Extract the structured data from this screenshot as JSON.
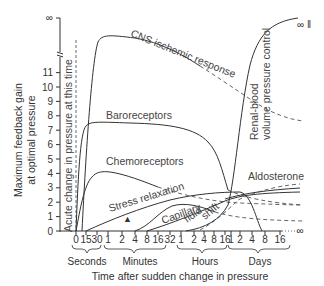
{
  "chart_data": {
    "type": "line",
    "title": "",
    "xlabel": "Time after sudden change in pressure",
    "ylabel_line1": "Maximum feedback gain",
    "ylabel_line2": "at optimal pressure",
    "y_ticks": [
      "0",
      "1",
      "2",
      "3",
      "4",
      "5",
      "6",
      "7",
      "8",
      "9",
      "10",
      "11"
    ],
    "y_infinity_label": "∞",
    "ylim": [
      0,
      11
    ],
    "x_ticks": [
      "0",
      "15",
      "30",
      "1",
      "2",
      "4",
      "8",
      "16",
      "32",
      "1",
      "2",
      "4",
      "8",
      "16",
      "1",
      "2",
      "4",
      "8",
      "16",
      "∞"
    ],
    "x_groups": [
      {
        "label": "Seconds",
        "ticks": [
          "0",
          "15",
          "30"
        ]
      },
      {
        "label": "Minutes",
        "ticks": [
          "1",
          "2",
          "4",
          "8",
          "16",
          "32"
        ]
      },
      {
        "label": "Hours",
        "ticks": [
          "1",
          "2",
          "4",
          "8",
          "16"
        ]
      },
      {
        "label": "Days",
        "ticks": [
          "1",
          "2",
          "4",
          "8",
          "16"
        ]
      }
    ],
    "grid": false,
    "legend": "inline curve labels",
    "annotations": {
      "acute_line": "Acute change in pressure at this time",
      "infinity_marker": "∞ ‖",
      "triangle_marker": "▲"
    },
    "series": [
      {
        "name": "CNS ischemic response",
        "x": [
          "15s",
          "30s",
          "1m",
          "4m",
          "32m",
          "4h",
          "16h",
          "2d",
          "16d"
        ],
        "values": [
          4,
          10.5,
          11,
          10.8,
          10.2,
          8.5,
          7.5,
          5.6,
          4.1
        ],
        "style": "solid then dashed"
      },
      {
        "name": "Baroreceptors",
        "x": [
          "0",
          "15s",
          "30s",
          "1m",
          "16m",
          "32m",
          "4h",
          "16h",
          "4d",
          "16d"
        ],
        "values": [
          0,
          6.5,
          7,
          7.1,
          7.0,
          6.8,
          5,
          3.3,
          2.2,
          1.9
        ],
        "style": "solid then dashed"
      },
      {
        "name": "Chemoreceptors",
        "x": [
          "0",
          "15s",
          "30s",
          "1m",
          "8m",
          "32m",
          "2h",
          "1d",
          "16d"
        ],
        "values": [
          0,
          2.2,
          3.5,
          4,
          3.8,
          3.2,
          2.5,
          2.1,
          1.9
        ],
        "style": "solid then dashed"
      },
      {
        "name": "Stress relaxation",
        "x": [
          "15s",
          "2m",
          "8m",
          "32m",
          "4h",
          "16h",
          "1d",
          "4d"
        ],
        "values": [
          0,
          0.6,
          1.2,
          1.9,
          2.5,
          2.6,
          2.6,
          0.2
        ],
        "style": "solid"
      },
      {
        "name": "Capillary fluid shift",
        "x": [
          "4m",
          "16m",
          "1h",
          "4h",
          "16h",
          "1d",
          "4d",
          "16d"
        ],
        "values": [
          0,
          1.5,
          1.9,
          1.6,
          1.0,
          0.8,
          0.6,
          0.6
        ],
        "style": "solid then dashed"
      },
      {
        "name": "Aldosterone",
        "x": [
          "8m",
          "1h",
          "4h",
          "16h",
          "1d",
          "4d",
          "16d"
        ],
        "values": [
          0,
          0.5,
          1.2,
          2.0,
          2.3,
          2.6,
          2.7
        ],
        "style": "solid"
      },
      {
        "name": "Renal-blood volume pressure control",
        "x": [
          "1h",
          "4h",
          "16h",
          "1d",
          "2d",
          "4d",
          "8d",
          "16d"
        ],
        "values": [
          0,
          0.4,
          1.2,
          2.4,
          6,
          10.5,
          "∞",
          "∞"
        ],
        "style": "solid"
      }
    ]
  },
  "labels": {
    "cns": "CNS ischemic response",
    "baro": "Baroreceptors",
    "chemo": "Chemoreceptors",
    "stress": "Stress relaxation",
    "capillary": "Capillary",
    "fluid": "fluid",
    "shift": "shift",
    "aldosterone": "Aldosterone",
    "renal1": "Renal-blood",
    "renal2": "volume pressure control",
    "acute": "Acute change in pressure at this time",
    "inf_right": "∞ ‖",
    "triangle": "▲"
  }
}
